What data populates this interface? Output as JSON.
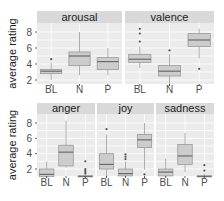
{
  "chart_data": {
    "type": "box",
    "ylabel": "average rating",
    "categories": [
      "BL",
      "N",
      "P"
    ],
    "yticks": [
      2,
      4,
      6,
      8
    ],
    "facets": [
      {
        "title": "arousal",
        "row": 0,
        "boxes": [
          {
            "cat": "BL",
            "min": 2.0,
            "q1": 2.8,
            "median": 3.1,
            "q3": 3.3,
            "max": 4.2,
            "outliers": [
              4.6
            ]
          },
          {
            "cat": "N",
            "min": 2.6,
            "q1": 3.8,
            "median": 5.0,
            "q3": 5.5,
            "max": 8.0,
            "outliers": []
          },
          {
            "cat": "P",
            "min": 2.6,
            "q1": 3.3,
            "median": 4.3,
            "q3": 4.8,
            "max": 6.0,
            "outliers": []
          }
        ]
      },
      {
        "title": "valence",
        "row": 0,
        "boxes": [
          {
            "cat": "BL",
            "min": 3.5,
            "q1": 4.2,
            "median": 4.6,
            "q3": 5.2,
            "max": 6.2,
            "outliers": [
              6.8,
              7.8,
              8.4
            ]
          },
          {
            "cat": "N",
            "min": 1.3,
            "q1": 2.5,
            "median": 3.1,
            "q3": 3.8,
            "max": 5.2,
            "outliers": [
              5.7
            ]
          },
          {
            "cat": "P",
            "min": 4.7,
            "q1": 6.2,
            "median": 7.0,
            "q3": 7.8,
            "max": 8.4,
            "outliers": [
              3.4
            ]
          }
        ]
      },
      {
        "title": "anger",
        "row": 1,
        "boxes": [
          {
            "cat": "BL",
            "min": 1.0,
            "q1": 1.0,
            "median": 1.3,
            "q3": 2.0,
            "max": 3.0,
            "outliers": []
          },
          {
            "cat": "N",
            "min": 2.2,
            "q1": 2.4,
            "median": 4.2,
            "q3": 5.1,
            "max": 8.3,
            "outliers": []
          },
          {
            "cat": "P",
            "min": 1.0,
            "q1": 1.0,
            "median": 1.05,
            "q3": 1.1,
            "max": 1.2,
            "outliers": [
              1.4,
              1.6,
              1.8,
              2.0,
              3.0
            ]
          }
        ]
      },
      {
        "title": "joy",
        "row": 1,
        "boxes": [
          {
            "cat": "BL",
            "min": 1.0,
            "q1": 2.0,
            "median": 2.6,
            "q3": 4.0,
            "max": 6.5,
            "outliers": [
              7.2
            ]
          },
          {
            "cat": "N",
            "min": 1.0,
            "q1": 1.1,
            "median": 1.4,
            "q3": 2.0,
            "max": 3.0,
            "outliers": [
              3.3,
              3.6,
              3.9
            ]
          },
          {
            "cat": "P",
            "min": 1.9,
            "q1": 4.8,
            "median": 5.8,
            "q3": 6.5,
            "max": 8.0,
            "outliers": [
              1.3
            ]
          }
        ]
      },
      {
        "title": "sadness",
        "row": 1,
        "boxes": [
          {
            "cat": "BL",
            "min": 1.0,
            "q1": 1.1,
            "median": 1.6,
            "q3": 2.0,
            "max": 3.4,
            "outliers": []
          },
          {
            "cat": "N",
            "min": 1.6,
            "q1": 2.6,
            "median": 3.7,
            "q3": 5.2,
            "max": 6.7,
            "outliers": []
          },
          {
            "cat": "P",
            "min": 1.0,
            "q1": 1.0,
            "median": 1.05,
            "q3": 1.1,
            "max": 1.4,
            "outliers": [
              1.8,
              2.5
            ]
          }
        ]
      }
    ],
    "colors": {
      "box_fill": "#cccccc",
      "panel_bg": "#ebebeb",
      "strip_bg": "#d9d9d9"
    }
  }
}
